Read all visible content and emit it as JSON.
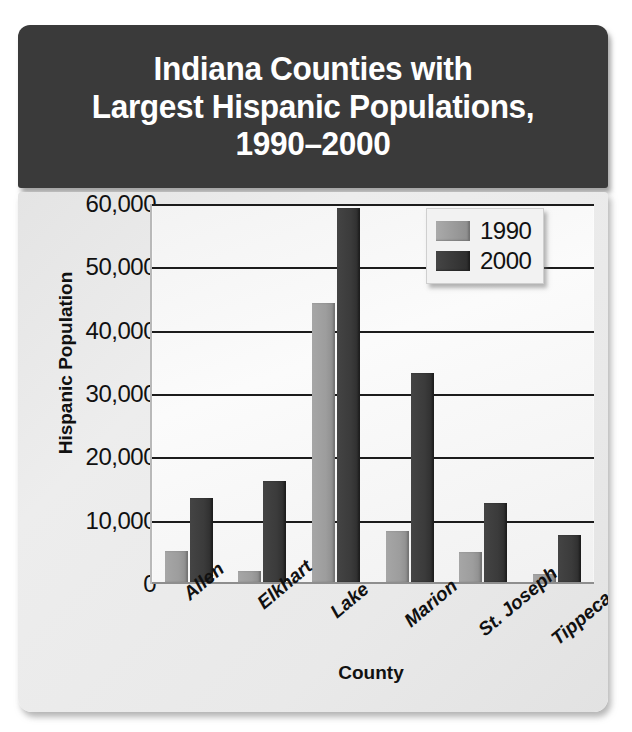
{
  "title": "Indiana Counties with Largest Hispanic Populations, 1990–2000",
  "title_lines": [
    "Indiana Counties with",
    "Largest Hispanic Populations,",
    "1990–2000"
  ],
  "colors": {
    "title_banner": "#3a3a3a",
    "panel": "#e9e9e9",
    "plot": "#f5f5f5",
    "series_1990": "#9a9a9a",
    "series_2000": "#333333",
    "gridline": "#1c1c1c",
    "text": "#111111"
  },
  "legend": {
    "position": "top-right",
    "entries": [
      {
        "label": "1990",
        "color": "#9a9a9a"
      },
      {
        "label": "2000",
        "color": "#333333"
      }
    ]
  },
  "axes": {
    "y_title": "Hispanic Population",
    "x_title": "County",
    "y_ticks": [
      "0",
      "10,000",
      "20,000",
      "30,000",
      "40,000",
      "50,000",
      "60,000"
    ]
  },
  "chart_data": {
    "type": "bar",
    "title": "Indiana Counties with Largest Hispanic Populations, 1990–2000",
    "xlabel": "County",
    "ylabel": "Hispanic Population",
    "ylim": [
      0,
      60000
    ],
    "ytick_values": [
      0,
      10000,
      20000,
      30000,
      40000,
      50000,
      60000
    ],
    "ytick_labels": [
      "0",
      "10,000",
      "20,000",
      "30,000",
      "40,000",
      "50,000",
      "60,000"
    ],
    "grid": true,
    "legend_position": "upper right",
    "categories": [
      "Allen",
      "Elkhart",
      "Lake",
      "Marion",
      "St. Joseph",
      "Tippecanoe"
    ],
    "series": [
      {
        "name": "1990",
        "color": "#9a9a9a",
        "values": [
          4900,
          1700,
          44000,
          8000,
          4800,
          1300
        ]
      },
      {
        "name": "2000",
        "color": "#333333",
        "values": [
          13300,
          16000,
          59000,
          33000,
          12500,
          7500
        ]
      }
    ]
  }
}
